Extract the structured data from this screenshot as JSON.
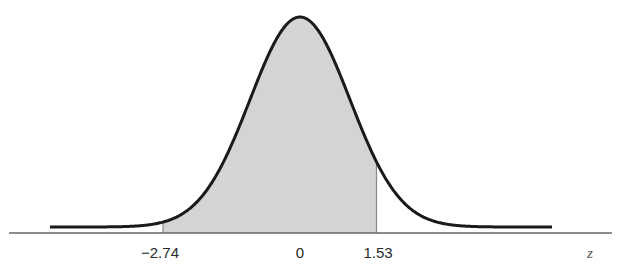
{
  "chart_data": {
    "type": "area",
    "title": "",
    "xlabel": "z",
    "ylabel": "",
    "distribution": {
      "name": "standard normal",
      "mean": 0,
      "sd": 1
    },
    "shaded_region": {
      "from": -2.74,
      "to": 1.53
    },
    "tick_labels": [
      "-2.74",
      "0",
      "1.53"
    ],
    "tick_values": [
      -2.74,
      0,
      1.53
    ],
    "xlim": [
      -5,
      5
    ],
    "grid": false,
    "legend": null,
    "colors": {
      "curve": "#1a1a1a",
      "fill": "#d4d4d4",
      "axis": "#666666",
      "boundary": "#888888"
    }
  },
  "labels": {
    "left": "−2.74",
    "center": "0",
    "right": "1.53",
    "axis": "z"
  }
}
